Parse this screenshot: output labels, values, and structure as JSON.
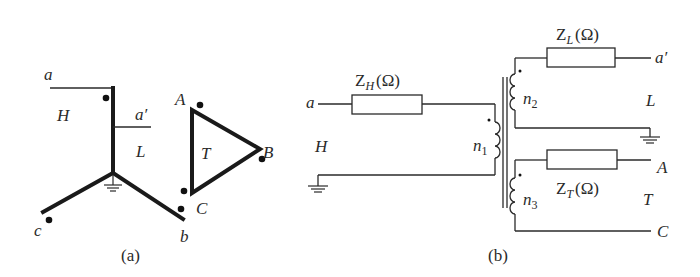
{
  "figure_a": {
    "caption": "(a)",
    "wye": {
      "terminals": [
        "a",
        "b",
        "c"
      ],
      "winding_labels": {
        "high": "H",
        "low": "L"
      },
      "tap_label": "a′"
    },
    "delta": {
      "vertices": [
        "A",
        "B",
        "C"
      ],
      "label": "T"
    }
  },
  "figure_b": {
    "caption": "(b)",
    "high_side": {
      "terminal": "a",
      "label": "H",
      "impedance": {
        "symbol": "Z",
        "sub": "H",
        "unit": "(Ω)"
      },
      "turns": {
        "symbol": "n",
        "sub": "1"
      }
    },
    "low_side": {
      "terminal": "a′",
      "label": "L",
      "impedance": {
        "symbol": "Z",
        "sub": "L",
        "unit": "(Ω)"
      },
      "turns": {
        "symbol": "n",
        "sub": "2"
      }
    },
    "tertiary": {
      "terminals": [
        "A",
        "C"
      ],
      "label": "T",
      "impedance": {
        "symbol": "Z",
        "sub": "T",
        "unit": "(Ω)"
      },
      "turns": {
        "symbol": "n",
        "sub": "3"
      }
    }
  }
}
